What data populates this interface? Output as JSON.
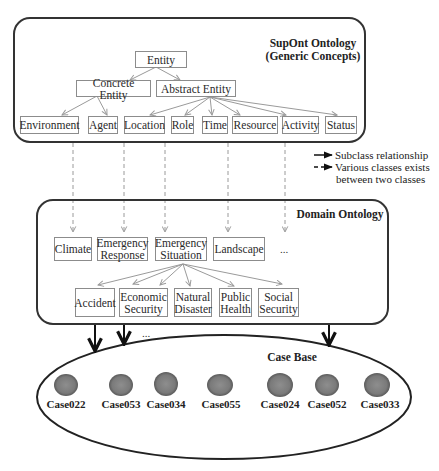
{
  "supont": {
    "title_line1": "SupOnt Ontology",
    "title_line2": "(Generic Concepts)",
    "nodes": {
      "entity": "Entity",
      "concrete": "Concrete Entity",
      "abstract": "Abstract Entity",
      "environment": "Environment",
      "agent": "Agent",
      "location": "Location",
      "role": "Role",
      "time": "Time",
      "resource": "Resource",
      "activity": "Activity",
      "status": "Status"
    }
  },
  "legend": {
    "solid": "Subclass relationship",
    "dashed_line1": "Various classes exists",
    "dashed_line2": "between two classes"
  },
  "domain": {
    "title": "Domain Ontology",
    "nodes": {
      "climate": "Climate",
      "emergency_response": "Emergency\nResponse",
      "emergency_situation": "Emergency\nSituation",
      "landscape": "Landscape",
      "ellipsis": "...",
      "accident": "Accident",
      "economic_security": "Economic\nSecurity",
      "natural_disaster": "Natural\nDisaster",
      "public_health": "Public\nHealth",
      "social_security": "Social\nSecurity"
    }
  },
  "casebase": {
    "title": "Case Base",
    "ellipsis": "...",
    "cases": [
      "Case022",
      "Case053",
      "Case034",
      "Case055",
      "Case024",
      "Case052",
      "Case033"
    ]
  },
  "colors": {
    "box_border": "#8c8c8c",
    "container_border": "#333333",
    "arrow_gray": "#9a9a9a",
    "arrow_black": "#111111",
    "case_fill": "#7a7a7a"
  }
}
